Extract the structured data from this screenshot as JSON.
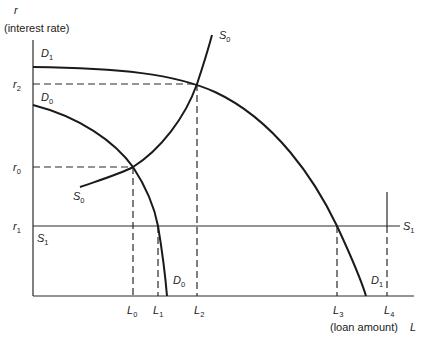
{
  "diagram": {
    "y_axis": {
      "symbol": "r",
      "label": "(interest rate)"
    },
    "x_axis": {
      "symbol": "L",
      "label": "(loan amount)"
    },
    "y_ticks": [
      {
        "main": "r",
        "sub": "2"
      },
      {
        "main": "r",
        "sub": "0"
      },
      {
        "main": "r",
        "sub": "1"
      }
    ],
    "x_ticks": [
      {
        "main": "L",
        "sub": "0"
      },
      {
        "main": "L",
        "sub": "1"
      },
      {
        "main": "L",
        "sub": "2"
      },
      {
        "main": "L",
        "sub": "3"
      },
      {
        "main": "L",
        "sub": "4"
      }
    ],
    "curves": {
      "D1_top": {
        "main": "D",
        "sub": "1"
      },
      "D0_top": {
        "main": "D",
        "sub": "0"
      },
      "S0_top": {
        "main": "S",
        "sub": "0"
      },
      "S0_bottom": {
        "main": "S",
        "sub": "0"
      },
      "S1_left": {
        "main": "S",
        "sub": "1"
      },
      "S1_right": {
        "main": "S",
        "sub": "1"
      },
      "D0_bottom": {
        "main": "D",
        "sub": "0"
      },
      "D1_bottom": {
        "main": "D",
        "sub": "1"
      }
    },
    "colors": {
      "line": "#1a1a1a",
      "background": "#ffffff"
    }
  }
}
